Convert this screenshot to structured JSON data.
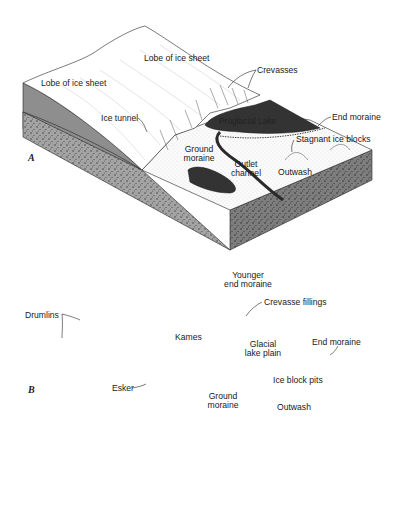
{
  "figure": {
    "panel_a": {
      "letter": "A",
      "labels": {
        "lobe_left": "Lobe of ice sheet",
        "lobe_top": "Lobe of ice sheet",
        "crevasses": "Crevasses",
        "ice_tunnel": "Ice tunnel",
        "proglacial_lake": "Proglacial Lake",
        "end_moraine": "End moraine",
        "stagnant_ice_blocks": "Stagnant ice blocks",
        "ground_moraine_1": "Ground",
        "ground_moraine_2": "moraine",
        "outlet_channel_1": "Outlet",
        "outlet_channel_2": "channel",
        "outwash": "Outwash"
      }
    },
    "panel_b": {
      "letter": "B",
      "labels": {
        "younger_end_moraine_1": "Younger",
        "younger_end_moraine_2": "end moraine",
        "crevasse_fillings": "Crevasse fillings",
        "drumlins": "Drumlins",
        "kames": "Kames",
        "glacial_lake_plain_1": "Glacial",
        "glacial_lake_plain_2": "lake plain",
        "end_moraine": "End moraine",
        "ice_block_pits": "Ice block pits",
        "esker": "Esker",
        "ground_moraine_1": "Ground",
        "ground_moraine_2": "moraine",
        "outwash": "Outwash"
      }
    },
    "colors": {
      "ink": "#1a1a1a",
      "ice_side": "#8a8a8a",
      "rock_side": "#9a9a9a",
      "lake": "#3a3a3a",
      "paper": "#ffffff"
    }
  }
}
